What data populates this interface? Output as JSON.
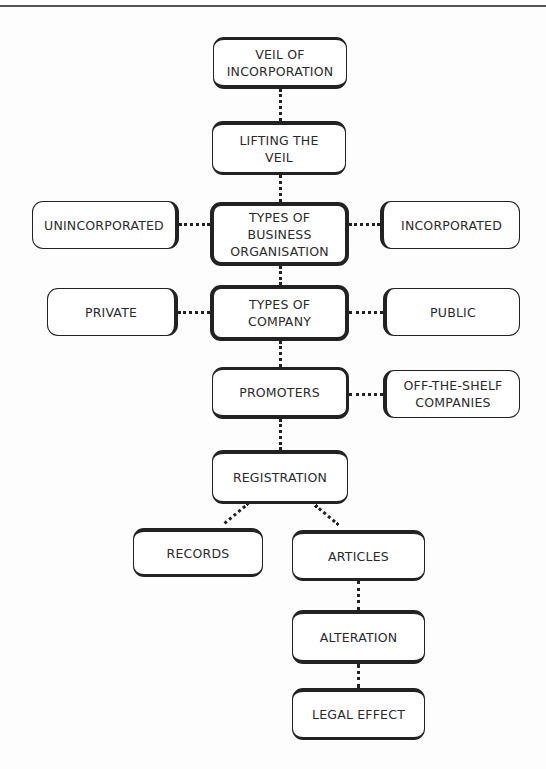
{
  "page": {
    "header_text": "Company Law — Chapter Summary"
  },
  "diagram": {
    "nodes": {
      "veil_of_incorporation": "VEIL OF INCORPORATION",
      "lifting_the_veil": "LIFTING THE VEIL",
      "types_of_business_organisation": "TYPES OF BUSINESS ORGANISATION",
      "unincorporated": "UNINCORPORATED",
      "incorporated": "INCORPORATED",
      "types_of_company": "TYPES OF COMPANY",
      "private": "PRIVATE",
      "public": "PUBLIC",
      "promoters": "PROMOTERS",
      "off_the_shelf_companies": "OFF-THE-SHELF COMPANIES",
      "registration": "REGISTRATION",
      "records": "RECORDS",
      "articles": "ARTICLES",
      "alteration": "ALTERATION",
      "legal_effect": "LEGAL EFFECT"
    },
    "edges": [
      [
        "veil_of_incorporation",
        "lifting_the_veil"
      ],
      [
        "lifting_the_veil",
        "types_of_business_organisation"
      ],
      [
        "types_of_business_organisation",
        "unincorporated"
      ],
      [
        "types_of_business_organisation",
        "incorporated"
      ],
      [
        "types_of_business_organisation",
        "types_of_company"
      ],
      [
        "types_of_company",
        "private"
      ],
      [
        "types_of_company",
        "public"
      ],
      [
        "types_of_company",
        "promoters"
      ],
      [
        "promoters",
        "off_the_shelf_companies"
      ],
      [
        "promoters",
        "registration"
      ],
      [
        "registration",
        "records"
      ],
      [
        "registration",
        "articles"
      ],
      [
        "articles",
        "alteration"
      ],
      [
        "alteration",
        "legal_effect"
      ]
    ]
  }
}
